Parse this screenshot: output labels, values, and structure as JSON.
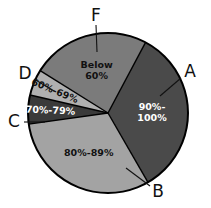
{
  "chart_data": {
    "type": "pie",
    "title": "",
    "subtitle": "",
    "xlabel": "",
    "ylabel": "",
    "legend_position": "callout-labels",
    "grid": false,
    "categories": [
      "90%-100%",
      "80%-89%",
      "70%-79%",
      "60%-69%",
      "Below 60%"
    ],
    "values": [
      34,
      31,
      6,
      5,
      24
    ],
    "units": "percent of total",
    "slices": [
      {
        "grade": "A",
        "label_line1": "90%-",
        "label_line2": "100%",
        "value": 34,
        "start_angle": 28,
        "end_angle": 150,
        "color": "#4a4a4a",
        "text_color": "#ffffff",
        "callout": "A"
      },
      {
        "grade": "B",
        "label_line1": "80%-89%",
        "label_line2": "",
        "value": 31,
        "start_angle": 150,
        "end_angle": 262,
        "color": "#a3a3a3",
        "text_color": "#111111",
        "callout": "B"
      },
      {
        "grade": "C",
        "label_line1": "70%-79%",
        "label_line2": "",
        "value": 6,
        "start_angle": 262,
        "end_angle": 283,
        "color": "#3a3a3a",
        "text_color": "#ffffff",
        "callout": "C"
      },
      {
        "grade": "D",
        "label_line1": "60%-69%",
        "label_line2": "",
        "value": 5,
        "start_angle": 283,
        "end_angle": 302,
        "color": "#b0b0b0",
        "text_color": "#111111",
        "callout": "D"
      },
      {
        "grade": "F",
        "label_line1": "Below",
        "label_line2": "60%",
        "value": 24,
        "start_angle": 302,
        "end_angle": 388,
        "color": "#7b7b7b",
        "text_color": "#111111",
        "callout": "F"
      }
    ],
    "callouts": [
      {
        "letter": "A",
        "x": 190,
        "y": 72,
        "line_x1": 181,
        "line_y1": 78,
        "line_x2": 160,
        "line_y2": 96
      },
      {
        "letter": "B",
        "x": 158,
        "y": 192,
        "line_x1": 150,
        "line_y1": 186,
        "line_x2": 126,
        "line_y2": 168
      },
      {
        "letter": "C",
        "x": 14,
        "y": 122,
        "line_x1": 24,
        "line_y1": 122,
        "line_x2": 45,
        "line_y2": 122
      },
      {
        "letter": "D",
        "x": 25,
        "y": 74,
        "line_x1": 34,
        "line_y1": 79,
        "line_x2": 54,
        "line_y2": 91
      },
      {
        "letter": "F",
        "x": 96,
        "y": 16,
        "line_x1": 96,
        "line_y1": 25,
        "line_x2": 97,
        "line_y2": 52
      }
    ],
    "geometry": {
      "cx": 108,
      "cy": 113,
      "r": 80
    }
  }
}
